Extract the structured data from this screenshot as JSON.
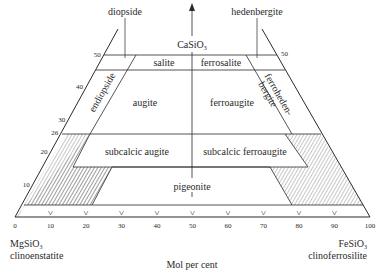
{
  "diagram": {
    "apex": {
      "label": "CaSiO",
      "subscript": "3"
    },
    "end_members_top": {
      "left": "diopside",
      "right": "hedenbergite"
    },
    "end_members_bottom": {
      "left": {
        "formula": "MgSiO",
        "subscript": "3",
        "name": "clinoenstatite"
      },
      "right": {
        "formula": "FeSiO",
        "subscript": "3",
        "name": "clinoferrosilite"
      }
    },
    "x_axis": {
      "label": "Mol per cent",
      "ticks": [
        "0",
        "10",
        "20",
        "30",
        "40",
        "50",
        "60",
        "70",
        "80",
        "90",
        "100"
      ]
    },
    "left_axis_ticks": [
      "10",
      "20",
      "26",
      "30",
      "40",
      "50"
    ],
    "right_axis_ticks": [
      "50"
    ],
    "fields": [
      {
        "name": "salite"
      },
      {
        "name": "ferrosalite"
      },
      {
        "name": "endiopside"
      },
      {
        "name": "augite"
      },
      {
        "name": "ferroaugite"
      },
      {
        "name": "ferrohedenbergite",
        "lines": [
          "ferroheden-",
          "bergite"
        ]
      },
      {
        "name": "subcalcic augite"
      },
      {
        "name": "subcalcic ferroaugite"
      },
      {
        "name": "pigeonite"
      }
    ]
  }
}
